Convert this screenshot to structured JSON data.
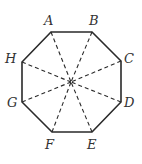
{
  "diagram": {
    "type": "regular-octagon-with-diagonals",
    "stroke_color": "#2a2a2a",
    "label_color": "#333333",
    "center": {
      "x": 71,
      "y": 82
    },
    "vertices": [
      {
        "id": "A",
        "x": 51,
        "y": 32,
        "label": "A",
        "lx": 44,
        "ly": 25
      },
      {
        "id": "B",
        "x": 92,
        "y": 32,
        "label": "B",
        "lx": 89,
        "ly": 25
      },
      {
        "id": "C",
        "x": 121,
        "y": 61,
        "label": "C",
        "lx": 124,
        "ly": 63
      },
      {
        "id": "D",
        "x": 121,
        "y": 102,
        "label": "D",
        "lx": 124,
        "ly": 107
      },
      {
        "id": "E",
        "x": 92,
        "y": 132,
        "label": "E",
        "lx": 87,
        "ly": 149
      },
      {
        "id": "F",
        "x": 52,
        "y": 132,
        "label": "F",
        "lx": 45,
        "ly": 149
      },
      {
        "id": "G",
        "x": 22,
        "y": 102,
        "label": "G",
        "lx": 7,
        "ly": 107
      },
      {
        "id": "H",
        "x": 22,
        "y": 62,
        "label": "H",
        "lx": 5,
        "ly": 63
      }
    ],
    "dashed_lines_to_center": [
      "A",
      "B",
      "C",
      "D",
      "E",
      "F",
      "G",
      "H"
    ]
  }
}
